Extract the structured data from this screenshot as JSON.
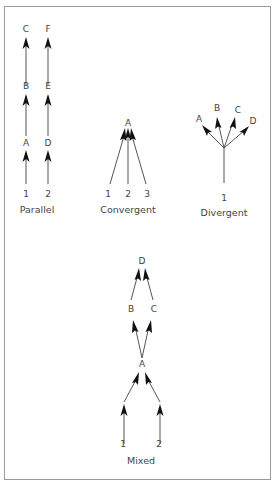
{
  "figure": {
    "parallel": {
      "caption": "Parallel",
      "columns": [
        {
          "bottom": "1",
          "nodes": [
            "A",
            "B",
            "C"
          ]
        },
        {
          "bottom": "2",
          "nodes": [
            "D",
            "E",
            "F"
          ]
        }
      ]
    },
    "convergent": {
      "caption": "Convergent",
      "target": "A",
      "sources": [
        "1",
        "2",
        "3"
      ]
    },
    "divergent": {
      "caption": "Divergent",
      "source": "1",
      "targets": [
        "A",
        "B",
        "C",
        "D"
      ]
    },
    "mixed": {
      "caption": "Mixed",
      "sources": [
        "1",
        "2"
      ],
      "middle": "A",
      "branches": [
        "B",
        "C"
      ],
      "top": "D"
    }
  },
  "colors": {
    "line": "#555555",
    "arrowhead": "#111111",
    "text": "#444444",
    "frame": "#9a9a9a"
  }
}
